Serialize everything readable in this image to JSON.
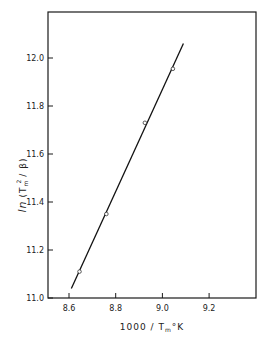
{
  "chart_data": {
    "type": "scatter",
    "title": "",
    "xlabel": "1000 / T_m °K",
    "ylabel": "ln (T_m^2 / β)",
    "xlim": [
      8.5,
      9.4
    ],
    "ylim": [
      11.0,
      12.2
    ],
    "xticks": [
      8.6,
      8.8,
      9.0,
      9.2
    ],
    "yticks": [
      11.0,
      11.2,
      11.4,
      11.6,
      11.8,
      12.0
    ],
    "xtick_labels": [
      "8.6",
      "8.8",
      "9.0",
      "9.2"
    ],
    "ytick_labels": [
      "11.0",
      "11.2",
      "11.4",
      "11.6",
      "11.8",
      "12.0"
    ],
    "grid": false,
    "legend": null,
    "series": [
      {
        "name": "measured",
        "marker": "open-circle",
        "x": [
          8.645,
          8.76,
          8.925,
          9.045
        ],
        "y": [
          11.11,
          11.35,
          11.73,
          11.955
        ]
      },
      {
        "name": "linear fit",
        "style": "line",
        "x": [
          8.61,
          9.09
        ],
        "y": [
          11.04,
          12.06
        ]
      }
    ]
  },
  "labels": {
    "xlabel_main": "1000 / T",
    "xlabel_sub": "m",
    "xlabel_unit": "°K",
    "ylabel_ln": "ln",
    "ylabel_open": "(T",
    "ylabel_sub": "m",
    "ylabel_sup": "2",
    "ylabel_rest": "/ β)"
  }
}
